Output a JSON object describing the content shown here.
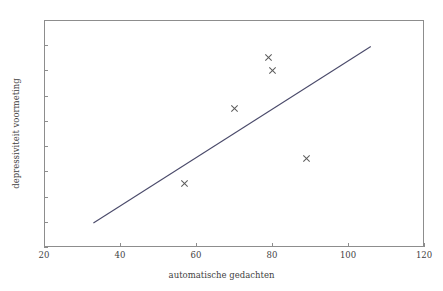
{
  "chart_data": {
    "type": "scatter",
    "title": "",
    "xlabel": "automatische gedachten",
    "ylabel": "depressiviteit voormeting",
    "xlim": [
      20,
      120
    ],
    "ylim": [
      8,
      26
    ],
    "xticks": [
      20,
      40,
      60,
      80,
      100,
      120
    ],
    "yticks": [
      8,
      10,
      12,
      14,
      16,
      18,
      20,
      22,
      24,
      26
    ],
    "grid": false,
    "legend": "none",
    "marker_style": "x",
    "marker_color": "#5a5a5a",
    "axis_color": "#8d8d8d",
    "points": [
      {
        "x": 57,
        "y": 13
      },
      {
        "x": 70,
        "y": 19
      },
      {
        "x": 79,
        "y": 23
      },
      {
        "x": 80,
        "y": 22
      },
      {
        "x": 89,
        "y": 15
      }
    ],
    "series": [
      {
        "name": "observaties",
        "x": [
          57,
          70,
          79,
          80,
          89
        ],
        "values": [
          13,
          19,
          23,
          22,
          15
        ]
      }
    ],
    "trendline": {
      "type": "linear",
      "color": "#4a4a6a",
      "x_start": 33,
      "y_start": 9.9,
      "x_end": 106,
      "y_end": 23.9
    }
  }
}
